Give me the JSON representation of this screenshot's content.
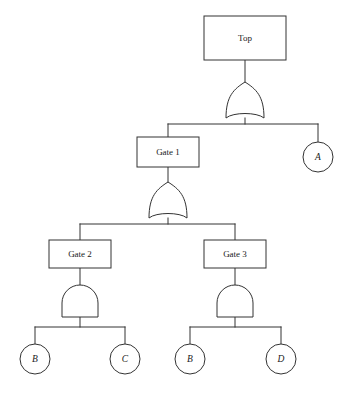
{
  "diagram": {
    "type": "fault-tree",
    "background_color": "#ffffff",
    "line_color": "#333333",
    "fill_color": "#ffffff"
  },
  "nodes": {
    "top": {
      "id": "top",
      "label": "Top",
      "shape": "rectangle",
      "role": "top-event",
      "x": 245,
      "y": 38,
      "width": 82,
      "height": 44
    },
    "gate1": {
      "id": "gate1",
      "label": "Gate 1",
      "shape": "rectangle",
      "role": "intermediate-event",
      "x": 168,
      "y": 152,
      "width": 62,
      "height": 30
    },
    "gate2": {
      "id": "gate2",
      "label": "Gate 2",
      "shape": "rectangle",
      "role": "intermediate-event",
      "x": 80,
      "y": 254,
      "width": 62,
      "height": 28
    },
    "gate3": {
      "id": "gate3",
      "label": "Gate 3",
      "shape": "rectangle",
      "role": "intermediate-event",
      "x": 235,
      "y": 254,
      "width": 62,
      "height": 28
    },
    "eventA": {
      "id": "eventA",
      "label": "A",
      "shape": "circle",
      "role": "basic-event",
      "x": 318,
      "y": 157,
      "radius": 15
    },
    "eventB1": {
      "id": "eventB1",
      "label": "B",
      "shape": "circle",
      "role": "basic-event",
      "x": 35,
      "y": 359,
      "radius": 15
    },
    "eventC": {
      "id": "eventC",
      "label": "C",
      "shape": "circle",
      "role": "basic-event",
      "x": 125,
      "y": 359,
      "radius": 15
    },
    "eventB2": {
      "id": "eventB2",
      "label": "B",
      "shape": "circle",
      "role": "basic-event",
      "x": 190,
      "y": 359,
      "radius": 15
    },
    "eventD": {
      "id": "eventD",
      "label": "D",
      "shape": "circle",
      "role": "basic-event",
      "x": 281,
      "y": 359,
      "radius": 15
    }
  },
  "gates": {
    "or_top": {
      "id": "or_top",
      "gate_type": "OR",
      "parent": "top",
      "children": [
        "gate1",
        "eventA"
      ],
      "x": 240,
      "y": 103
    },
    "or_gate1": {
      "id": "or_gate1",
      "gate_type": "OR",
      "parent": "gate1",
      "children": [
        "gate2",
        "gate3"
      ],
      "x": 168,
      "y": 203
    },
    "and_gate2": {
      "id": "and_gate2",
      "gate_type": "AND",
      "parent": "gate2",
      "children": [
        "eventB1",
        "eventC"
      ],
      "x": 80,
      "y": 303
    },
    "and_gate3": {
      "id": "and_gate3",
      "gate_type": "AND",
      "parent": "gate3",
      "children": [
        "eventB2",
        "eventD"
      ],
      "x": 235,
      "y": 303
    }
  },
  "edges": [
    {
      "from": "top",
      "to": "or_top",
      "kind": "vertical"
    },
    {
      "from": "or_top",
      "to": "bus_top",
      "kind": "vertical"
    },
    {
      "from": "bus_top",
      "to": "gate1",
      "kind": "branch"
    },
    {
      "from": "bus_top",
      "to": "eventA",
      "kind": "branch"
    },
    {
      "from": "gate1",
      "to": "or_gate1",
      "kind": "vertical"
    },
    {
      "from": "or_gate1",
      "to": "bus_mid",
      "kind": "vertical"
    },
    {
      "from": "bus_mid",
      "to": "gate2",
      "kind": "branch"
    },
    {
      "from": "bus_mid",
      "to": "gate3",
      "kind": "branch"
    },
    {
      "from": "gate2",
      "to": "and_gate2",
      "kind": "vertical"
    },
    {
      "from": "and_gate2",
      "to": "bus_left",
      "kind": "vertical"
    },
    {
      "from": "bus_left",
      "to": "eventB1",
      "kind": "branch"
    },
    {
      "from": "bus_left",
      "to": "eventC",
      "kind": "branch"
    },
    {
      "from": "gate3",
      "to": "and_gate3",
      "kind": "vertical"
    },
    {
      "from": "and_gate3",
      "to": "bus_right",
      "kind": "vertical"
    },
    {
      "from": "bus_right",
      "to": "eventB2",
      "kind": "branch"
    },
    {
      "from": "bus_right",
      "to": "eventD",
      "kind": "branch"
    }
  ]
}
